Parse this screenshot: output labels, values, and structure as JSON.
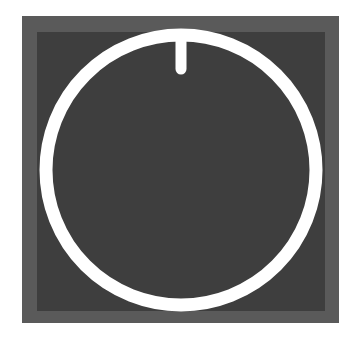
{
  "icon": {
    "name": "power-button-icon",
    "colors": {
      "background": "#ffffff",
      "outer_square": "#5a5a5a",
      "inner_square": "#3e3e3e",
      "ring": "#ffffff"
    }
  }
}
